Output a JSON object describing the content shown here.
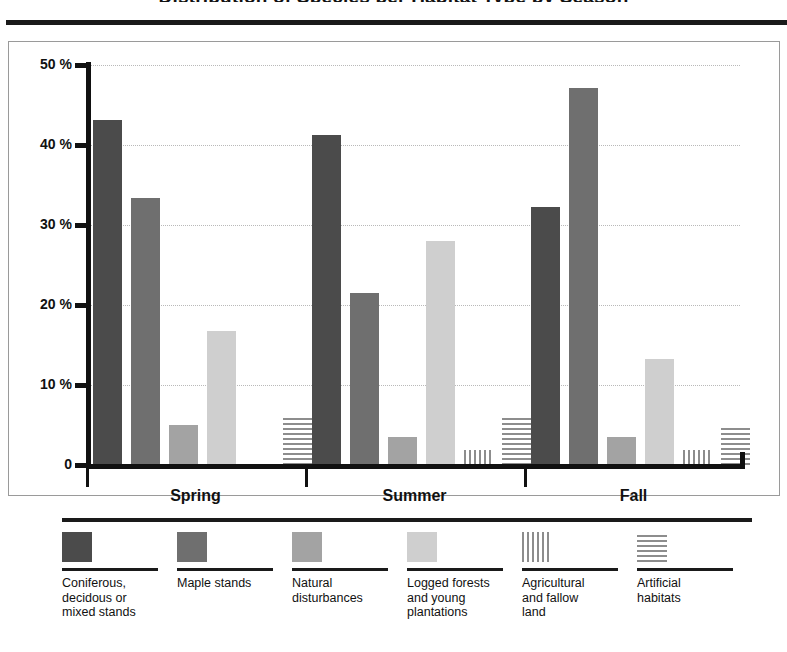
{
  "chart": {
    "title": "Distribution of Species per Habitat Type by Season",
    "y_axis": {
      "unit": "%",
      "ticks": [
        "50 %",
        "40 %",
        "30 %",
        "20 %",
        "10 %",
        "0"
      ]
    },
    "x_axis": {
      "groups": [
        "Spring",
        "Summer",
        "Fall"
      ]
    }
  },
  "legend": {
    "items": [
      {
        "label": "Coniferous,\ndecidous or\nmixed stands",
        "swatch": "solid-dark-gray",
        "color": "#4b4b4b"
      },
      {
        "label": "Maple stands",
        "swatch": "solid-medium-gray",
        "color": "#6f6f6f"
      },
      {
        "label": "Natural\ndisturbances",
        "swatch": "solid-gray",
        "color": "#a3a3a3"
      },
      {
        "label": "Logged forests\nand young\nplantations",
        "swatch": "solid-light-gray",
        "color": "#cfcfcf"
      },
      {
        "label": "Agricultural\nand fallow\nland",
        "swatch": "vertical-stripes",
        "color": "#8d8d8d"
      },
      {
        "label": "Artificial\nhabitats",
        "swatch": "horizontal-stripes",
        "color": "#8d8d8d"
      }
    ]
  },
  "chart_data": {
    "type": "bar",
    "title": "Distribution of Species per Habitat Type by Season",
    "xlabel": "",
    "ylabel": "%",
    "ylim": [
      0,
      50
    ],
    "yticks": [
      0,
      10,
      20,
      30,
      40,
      50
    ],
    "grid": true,
    "legend_position": "bottom",
    "categories": [
      "Spring",
      "Summer",
      "Fall"
    ],
    "series": [
      {
        "name": "Coniferous, decidous or mixed stands",
        "values": [
          43.1,
          41.2,
          32.3
        ]
      },
      {
        "name": "Maple stands",
        "values": [
          33.4,
          21.5,
          47.1
        ]
      },
      {
        "name": "Natural disturbances",
        "values": [
          5.0,
          3.5,
          3.5
        ]
      },
      {
        "name": "Logged forests and young plantations",
        "values": [
          16.7,
          28.0,
          13.3
        ]
      },
      {
        "name": "Agricultural and fallow land",
        "values": [
          0.0,
          1.9,
          1.9
        ]
      },
      {
        "name": "Artificial habitats",
        "values": [
          6.2,
          6.2,
          5.0
        ]
      }
    ]
  }
}
